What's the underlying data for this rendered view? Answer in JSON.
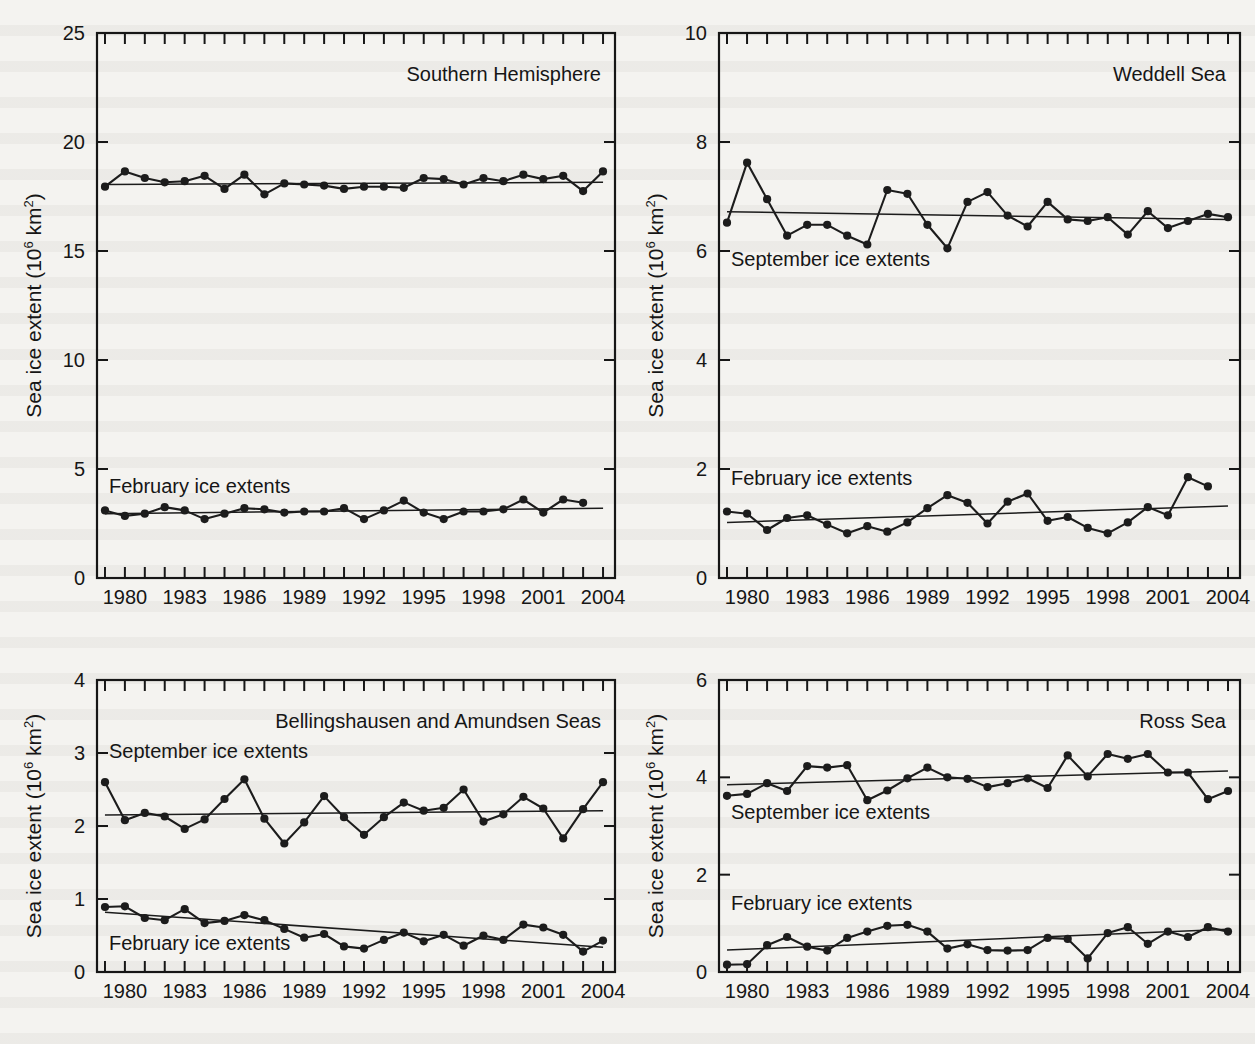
{
  "figure": {
    "axis_title": "Sea ice extent (10",
    "axis_title_sup": "6",
    "axis_title_tail": " km",
    "axis_title_sup2": "2",
    "axis_title_end": ")",
    "series_label_september": "September ice extents",
    "series_label_february": "February ice extents",
    "xticklabels": [
      "1980",
      "1983",
      "1986",
      "1989",
      "1992",
      "1995",
      "1998",
      "2001",
      "2004"
    ],
    "xtick_years": [
      1980,
      1983,
      1986,
      1989,
      1992,
      1995,
      1998,
      2001,
      2004
    ],
    "ink_color": "#1c1c1c",
    "paper_color": "#f4f3f0"
  },
  "chart_data": [
    {
      "type": "line",
      "panel": "southern-hemisphere",
      "title": "Southern Hemisphere",
      "xlabel": "",
      "ylabel": "Sea ice extent (10^6 km^2)",
      "xlim": [
        1978.6,
        2004.6
      ],
      "ylim": [
        0,
        25
      ],
      "yticks": [
        0,
        5,
        10,
        15,
        20,
        25
      ],
      "yticklabels": [
        "0",
        "5",
        "10",
        "15",
        "20",
        "25"
      ],
      "grid": false,
      "legend": "inline-labels",
      "x": [
        1979,
        1980,
        1981,
        1982,
        1983,
        1984,
        1985,
        1986,
        1987,
        1988,
        1989,
        1990,
        1991,
        1992,
        1993,
        1994,
        1995,
        1996,
        1997,
        1998,
        1999,
        2000,
        2001,
        2002,
        2003,
        2004
      ],
      "series": [
        {
          "name": "September ice extents",
          "values": [
            17.95,
            18.65,
            18.35,
            18.15,
            18.2,
            18.45,
            17.85,
            18.5,
            17.6,
            18.1,
            18.05,
            18.0,
            17.85,
            17.95,
            17.95,
            17.9,
            18.35,
            18.3,
            18.05,
            18.35,
            18.2,
            18.5,
            18.3,
            18.45,
            17.75,
            18.65
          ],
          "trend": {
            "start_year": 1979,
            "start_value": 18.05,
            "end_year": 2004,
            "end_value": 18.15
          }
        },
        {
          "name": "February ice extents",
          "values": [
            3.1,
            2.85,
            2.95,
            3.25,
            3.1,
            2.7,
            2.95,
            3.2,
            3.15,
            3.0,
            3.05,
            3.05,
            3.2,
            2.7,
            3.1,
            3.55,
            3.0,
            2.7,
            3.05,
            3.05,
            3.15,
            3.6,
            3.0,
            3.6,
            3.45,
            null
          ],
          "trend": {
            "start_year": 1979,
            "start_value": 2.95,
            "end_year": 2004,
            "end_value": 3.2
          }
        }
      ]
    },
    {
      "type": "line",
      "panel": "weddell-sea",
      "title": "Weddell Sea",
      "xlabel": "",
      "ylabel": "Sea ice extent (10^6 km^2)",
      "xlim": [
        1978.6,
        2004.6
      ],
      "ylim": [
        0,
        10
      ],
      "yticks": [
        0,
        2,
        4,
        6,
        8,
        10
      ],
      "yticklabels": [
        "0",
        "2",
        "4",
        "6",
        "8",
        "10"
      ],
      "grid": false,
      "legend": "inline-labels",
      "x": [
        1979,
        1980,
        1981,
        1982,
        1983,
        1984,
        1985,
        1986,
        1987,
        1988,
        1989,
        1990,
        1991,
        1992,
        1993,
        1994,
        1995,
        1996,
        1997,
        1998,
        1999,
        2000,
        2001,
        2002,
        2003,
        2004
      ],
      "series": [
        {
          "name": "September ice extents",
          "values": [
            6.52,
            7.62,
            6.95,
            6.28,
            6.48,
            6.48,
            6.28,
            6.12,
            7.12,
            7.05,
            6.48,
            6.05,
            6.9,
            7.08,
            6.65,
            6.45,
            6.9,
            6.58,
            6.55,
            6.62,
            6.3,
            6.73,
            6.42,
            6.55,
            6.68,
            6.62
          ],
          "trend": {
            "start_year": 1979,
            "start_value": 6.72,
            "end_year": 2004,
            "end_value": 6.58
          }
        },
        {
          "name": "February ice extents",
          "values": [
            1.22,
            1.18,
            0.88,
            1.1,
            1.15,
            0.98,
            0.82,
            0.95,
            0.85,
            1.02,
            1.28,
            1.52,
            1.38,
            1.0,
            1.4,
            1.55,
            1.05,
            1.12,
            0.92,
            0.82,
            1.02,
            1.3,
            1.15,
            1.85,
            1.68,
            null
          ],
          "trend": {
            "start_year": 1979,
            "start_value": 1.02,
            "end_year": 2004,
            "end_value": 1.32
          }
        }
      ]
    },
    {
      "type": "line",
      "panel": "bellingshausen-amundsen-seas",
      "title": "Bellingshausen and Amundsen Seas",
      "xlabel": "",
      "ylabel": "Sea ice extent (10^6 km^2)",
      "xlim": [
        1978.6,
        2004.6
      ],
      "ylim": [
        0,
        4
      ],
      "yticks": [
        0,
        1,
        2,
        3,
        4
      ],
      "yticklabels": [
        "0",
        "1",
        "2",
        "3",
        "4"
      ],
      "grid": false,
      "legend": "inline-labels",
      "x": [
        1979,
        1980,
        1981,
        1982,
        1983,
        1984,
        1985,
        1986,
        1987,
        1988,
        1989,
        1990,
        1991,
        1992,
        1993,
        1994,
        1995,
        1996,
        1997,
        1998,
        1999,
        2000,
        2001,
        2002,
        2003,
        2004
      ],
      "series": [
        {
          "name": "September ice extents",
          "values": [
            2.6,
            2.08,
            2.18,
            2.13,
            1.96,
            2.09,
            2.37,
            2.64,
            2.1,
            1.76,
            2.05,
            2.41,
            2.12,
            1.88,
            2.12,
            2.32,
            2.21,
            2.25,
            2.5,
            2.06,
            2.16,
            2.4,
            2.24,
            1.83,
            2.23,
            2.6
          ],
          "trend": {
            "start_year": 1979,
            "start_value": 2.15,
            "end_year": 2004,
            "end_value": 2.21
          }
        },
        {
          "name": "February ice extents",
          "values": [
            0.89,
            0.9,
            0.74,
            0.71,
            0.86,
            0.67,
            0.7,
            0.78,
            0.71,
            0.59,
            0.47,
            0.52,
            0.35,
            0.32,
            0.44,
            0.54,
            0.42,
            0.51,
            0.36,
            0.5,
            0.44,
            0.65,
            0.61,
            0.51,
            0.28,
            0.43
          ],
          "trend": {
            "start_year": 1979,
            "start_value": 0.82,
            "end_year": 2004,
            "end_value": 0.34
          }
        }
      ]
    },
    {
      "type": "line",
      "panel": "ross-sea",
      "title": "Ross Sea",
      "xlabel": "",
      "ylabel": "Sea ice extent (10^6 km^2)",
      "xlim": [
        1978.6,
        2004.6
      ],
      "ylim": [
        0,
        6
      ],
      "yticks": [
        0,
        2,
        4,
        6
      ],
      "yticklabels": [
        "0",
        "2",
        "4",
        "6"
      ],
      "grid": false,
      "legend": "inline-labels",
      "x": [
        1979,
        1980,
        1981,
        1982,
        1983,
        1984,
        1985,
        1986,
        1987,
        1988,
        1989,
        1990,
        1991,
        1992,
        1993,
        1994,
        1995,
        1996,
        1997,
        1998,
        1999,
        2000,
        2001,
        2002,
        2003,
        2004
      ],
      "series": [
        {
          "name": "September ice extents",
          "values": [
            3.62,
            3.66,
            3.88,
            3.72,
            4.23,
            4.2,
            4.25,
            3.53,
            3.73,
            3.98,
            4.2,
            4.0,
            3.97,
            3.8,
            3.88,
            3.98,
            3.78,
            4.45,
            4.02,
            4.48,
            4.38,
            4.48,
            4.1,
            4.1,
            3.55,
            3.72
          ],
          "trend": {
            "start_year": 1979,
            "start_value": 3.85,
            "end_year": 2004,
            "end_value": 4.13
          }
        },
        {
          "name": "February ice extents",
          "values": [
            0.15,
            0.16,
            0.55,
            0.72,
            0.52,
            0.44,
            0.7,
            0.83,
            0.95,
            0.97,
            0.83,
            0.48,
            0.57,
            0.45,
            0.44,
            0.45,
            0.7,
            0.68,
            0.28,
            0.8,
            0.92,
            0.58,
            0.83,
            0.72,
            0.92,
            0.83
          ],
          "trend": {
            "start_year": 1979,
            "start_value": 0.45,
            "end_year": 2004,
            "end_value": 0.88
          }
        }
      ]
    }
  ]
}
